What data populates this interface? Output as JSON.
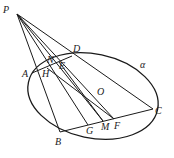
{
  "figure": {
    "type": "geometry-diagram",
    "plane_label": "α",
    "center_label": "O",
    "points": {
      "P": {
        "label": "P",
        "x": 17,
        "y": 14,
        "lx": 3,
        "ly": 13
      },
      "A": {
        "label": "A",
        "x": 32,
        "y": 73,
        "lx": 23,
        "ly": 77
      },
      "D": {
        "label": "D",
        "x": 72,
        "y": 56,
        "lx": 72,
        "ly": 51
      },
      "C": {
        "label": "C",
        "x": 153,
        "y": 109,
        "lx": 155,
        "ly": 113
      },
      "B": {
        "label": "B",
        "x": 60,
        "y": 132,
        "lx": 55,
        "ly": 144
      },
      "N": {
        "label": "N",
        "x": 53,
        "y": 63,
        "lx": 48,
        "ly": 64
      },
      "E": {
        "label": "E",
        "x": 59,
        "y": 62,
        "lx": 59,
        "ly": 69
      },
      "H": {
        "label": "H",
        "x": 47,
        "y": 68,
        "lx": 43,
        "ly": 77
      },
      "G": {
        "label": "G",
        "x": 88,
        "y": 125,
        "lx": 86,
        "ly": 134
      },
      "M": {
        "label": "M",
        "x": 103,
        "y": 121,
        "lx": 101,
        "ly": 130
      },
      "F": {
        "label": "F",
        "x": 114,
        "y": 119,
        "lx": 114,
        "ly": 129
      }
    },
    "labels": {
      "P": "P",
      "A": "A",
      "D": "D",
      "C": "C",
      "B": "B",
      "N": "N",
      "E": "E",
      "H": "H",
      "G": "G",
      "M": "M",
      "F": "F",
      "O": "O",
      "alpha": "α"
    }
  }
}
